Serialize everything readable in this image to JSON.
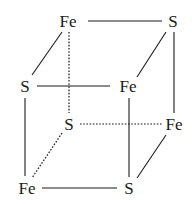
{
  "colors": {
    "ink": "#1a1a1a",
    "background": "#ffffff"
  },
  "atoms": [
    {
      "id": "top-back-left",
      "label": "Fe",
      "x": 68,
      "y": 21
    },
    {
      "id": "top-back-right",
      "label": "S",
      "x": 173,
      "y": 21
    },
    {
      "id": "top-front-left",
      "label": "S",
      "x": 25,
      "y": 86
    },
    {
      "id": "top-front-right",
      "label": "Fe",
      "x": 128,
      "y": 86
    },
    {
      "id": "bottom-back-left",
      "label": "S",
      "x": 69,
      "y": 124
    },
    {
      "id": "bottom-back-right",
      "label": "Fe",
      "x": 174,
      "y": 124
    },
    {
      "id": "bottom-front-left",
      "label": "Fe",
      "x": 27,
      "y": 188
    },
    {
      "id": "bottom-front-right",
      "label": "S",
      "x": 129,
      "y": 188
    }
  ],
  "bonds": [
    {
      "from": "top-back-left",
      "to": "top-back-right",
      "style": "solid",
      "x1": 88,
      "y1": 21,
      "x2": 162,
      "y2": 21
    },
    {
      "from": "top-back-left",
      "to": "top-front-left",
      "style": "solid",
      "x1": 62,
      "y1": 32,
      "x2": 32,
      "y2": 75
    },
    {
      "from": "top-back-right",
      "to": "top-front-right",
      "style": "solid",
      "x1": 166,
      "y1": 32,
      "x2": 137,
      "y2": 77
    },
    {
      "from": "top-front-left",
      "to": "top-front-right",
      "style": "solid",
      "x1": 37,
      "y1": 86,
      "x2": 110,
      "y2": 86
    },
    {
      "from": "top-back-right",
      "to": "bottom-back-right",
      "style": "solid",
      "x1": 174,
      "y1": 32,
      "x2": 174,
      "y2": 113
    },
    {
      "from": "top-back-left",
      "to": "bottom-back-left",
      "style": "dashed",
      "x1": 69,
      "y1": 32,
      "x2": 69,
      "y2": 113
    },
    {
      "from": "top-front-left",
      "to": "bottom-front-left",
      "style": "solid",
      "x1": 25,
      "y1": 98,
      "x2": 25,
      "y2": 176
    },
    {
      "from": "top-front-right",
      "to": "bottom-front-right",
      "style": "solid",
      "x1": 129,
      "y1": 98,
      "x2": 129,
      "y2": 177
    },
    {
      "from": "bottom-back-left",
      "to": "bottom-back-right",
      "style": "dashed",
      "x1": 80,
      "y1": 124,
      "x2": 162,
      "y2": 124
    },
    {
      "from": "bottom-back-left",
      "to": "bottom-front-left",
      "style": "dashed",
      "x1": 62,
      "y1": 133,
      "x2": 32,
      "y2": 178
    },
    {
      "from": "bottom-back-right",
      "to": "bottom-front-right",
      "style": "solid",
      "x1": 166,
      "y1": 135,
      "x2": 137,
      "y2": 178
    },
    {
      "from": "bottom-front-left",
      "to": "bottom-front-right",
      "style": "solid",
      "x1": 42,
      "y1": 188,
      "x2": 117,
      "y2": 188
    }
  ]
}
